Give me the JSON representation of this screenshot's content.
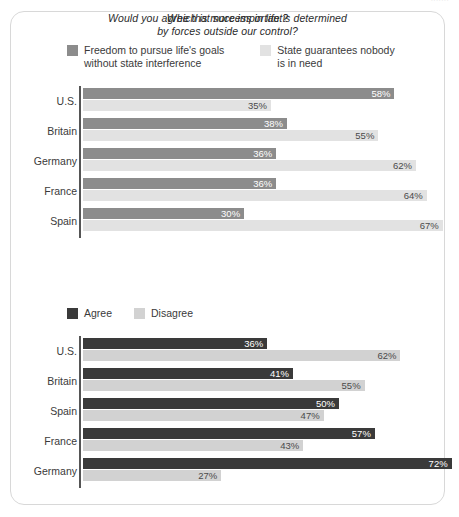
{
  "top_strip": {
    "ghost_text": "......."
  },
  "card": {
    "charts": [
      {
        "id": "chart-importance",
        "title": "Which is more important?",
        "legend": [
          {
            "name": "freedom",
            "label": "Freedom to pursue life's goals\nwithout state interference",
            "color": "#8c8c8c"
          },
          {
            "name": "state-guarantee",
            "label": "State guarantees nobody\nis in need",
            "color": "#e2e2e2"
          }
        ],
        "chart_data": {
          "type": "bar",
          "orientation": "horizontal",
          "title": "Which is more important?",
          "xlabel": "",
          "ylabel": "",
          "xlim": [
            0,
            70
          ],
          "grid": false,
          "legend_position": "top",
          "categories": [
            "U.S.",
            "Britain",
            "Germany",
            "France",
            "Spain"
          ],
          "series": [
            {
              "name": "Freedom to pursue life's goals without state interference",
              "color": "#8c8c8c",
              "values": [
                58,
                38,
                36,
                36,
                30
              ],
              "labels": [
                "58%",
                "38%",
                "36%",
                "36%",
                "30%"
              ]
            },
            {
              "name": "State guarantees nobody is in need",
              "color": "#e2e2e2",
              "values": [
                35,
                55,
                62,
                64,
                67
              ],
              "labels": [
                "35%",
                "55%",
                "62%",
                "64%",
                "67%"
              ]
            }
          ]
        }
      },
      {
        "id": "chart-success-forces",
        "title": "Would you agree that success in life is determined\nby forces outside our control?",
        "legend": [
          {
            "name": "agree",
            "label": "Agree",
            "color": "#3a3a3a"
          },
          {
            "name": "disagree",
            "label": "Disagree",
            "color": "#d2d2d2"
          }
        ],
        "chart_data": {
          "type": "bar",
          "orientation": "horizontal",
          "title": "Would you agree that success in life is determined by forces outside our control?",
          "xlabel": "",
          "ylabel": "",
          "xlim": [
            0,
            75
          ],
          "grid": false,
          "legend_position": "top",
          "categories": [
            "U.S.",
            "Britain",
            "Spain",
            "France",
            "Germany"
          ],
          "series": [
            {
              "name": "Agree",
              "color": "#3a3a3a",
              "values": [
                36,
                41,
                50,
                57,
                72
              ],
              "labels": [
                "36%",
                "41%",
                "50%",
                "57%",
                "72%"
              ]
            },
            {
              "name": "Disagree",
              "color": "#d2d2d2",
              "values": [
                62,
                55,
                47,
                43,
                27
              ],
              "labels": [
                "62%",
                "55%",
                "47%",
                "43%",
                "27%"
              ]
            }
          ]
        }
      }
    ]
  }
}
